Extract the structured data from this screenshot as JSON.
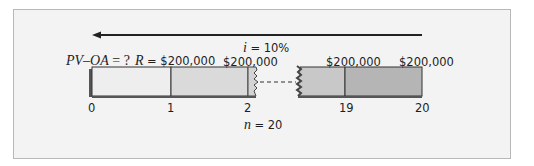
{
  "diagram": {
    "title_arrow": {
      "direction": "left"
    },
    "interest_label": {
      "var": "i",
      "value": "= 10%"
    },
    "pv_label": {
      "var": "PV–OA",
      "value": "= ?"
    },
    "payment_label": {
      "var": "R",
      "value": "= $200,000"
    },
    "payments": [
      "$200,000",
      "$200,000",
      "$200,000"
    ],
    "periods": [
      "0",
      "1",
      "2",
      "19",
      "20"
    ],
    "n_label": {
      "var": "n",
      "value": "= 20"
    },
    "colors": {
      "panel_bg": "#f3f3f3",
      "panel_border": "#b8b8b8",
      "segment_1": "#ececec",
      "segment_2": "#d6d6d6",
      "segment_19": "#c4c4c4",
      "segment_20": "#b3b3b3",
      "outline": "#333333"
    }
  }
}
